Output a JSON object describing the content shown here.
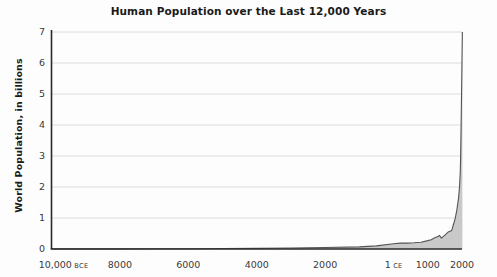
{
  "chart_data": {
    "type": "area",
    "title": "Human Population over the Last 12,000 Years",
    "xlabel": "",
    "ylabel": "World Population, in billions",
    "xlim": [
      -10000,
      2000
    ],
    "ylim": [
      0,
      7
    ],
    "grid": true,
    "legend": false,
    "line_color": "#555555",
    "fill_color": "#c9c9c9",
    "axis_color": "#2b2b2b",
    "grid_color": "#dcdcdc",
    "yticks": [
      7,
      6,
      5,
      4,
      3,
      2,
      1,
      0
    ],
    "ytick_labels": [
      "7",
      "6",
      "5",
      "4",
      "3",
      "2",
      "1",
      "0"
    ],
    "xticks": [
      -10000,
      -8000,
      -6000,
      -4000,
      -2000,
      1,
      1000,
      2000
    ],
    "xtick_labels": [
      {
        "value": "10,000",
        "era": "BCE"
      },
      {
        "value": "8000",
        "era": ""
      },
      {
        "value": "6000",
        "era": ""
      },
      {
        "value": "4000",
        "era": ""
      },
      {
        "value": "2000",
        "era": ""
      },
      {
        "value": "1",
        "era": "CE"
      },
      {
        "value": "1000",
        "era": ""
      },
      {
        "value": "2000",
        "era": ""
      }
    ],
    "x": [
      -10000,
      -9000,
      -8000,
      -7000,
      -6000,
      -5000,
      -4000,
      -3000,
      -2000,
      -1000,
      -500,
      1,
      200,
      400,
      600,
      800,
      1000,
      1100,
      1200,
      1300,
      1340,
      1400,
      1500,
      1600,
      1700,
      1750,
      1800,
      1850,
      1900,
      1927,
      1950,
      1960,
      1974,
      1987,
      1999,
      2000,
      2011
    ],
    "y": [
      0.004,
      0.005,
      0.005,
      0.007,
      0.01,
      0.015,
      0.02,
      0.03,
      0.05,
      0.07,
      0.1,
      0.17,
      0.19,
      0.19,
      0.2,
      0.22,
      0.27,
      0.3,
      0.36,
      0.4,
      0.44,
      0.35,
      0.45,
      0.55,
      0.6,
      0.79,
      0.98,
      1.26,
      1.65,
      2.0,
      2.5,
      3.0,
      4.0,
      5.0,
      6.0,
      6.1,
      7.0
    ],
    "units": "billions"
  }
}
